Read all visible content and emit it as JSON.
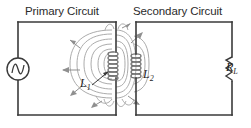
{
  "diagram": {
    "type": "circuit-schematic",
    "colors": {
      "wire": "#3a3a3a",
      "coil": "#6e6e6e",
      "field_line": "#9a9a9a",
      "arrow": "#8f8f8f",
      "text": "#2b2b2b",
      "background": "#ffffff"
    },
    "headings": {
      "primary": "Primary Circuit",
      "secondary": "Secondary Circuit"
    },
    "labels": {
      "l1": "L",
      "l1_sub": "1",
      "l2": "L",
      "l2_sub": "2",
      "rl": "R",
      "rl_sub": "L"
    },
    "components": [
      {
        "name": "ac-source",
        "symbol": "sine-in-circle",
        "circuit": "primary"
      },
      {
        "name": "inductor-l1",
        "symbol": "coil",
        "turns": 7,
        "circuit": "primary"
      },
      {
        "name": "inductor-l2",
        "symbol": "coil",
        "turns": 6,
        "circuit": "secondary"
      },
      {
        "name": "load-resistor-rl",
        "symbol": "zigzag",
        "circuit": "secondary"
      }
    ],
    "field_lines": {
      "count": 8,
      "description": "magnetic flux loops linking L1 and L2"
    }
  }
}
